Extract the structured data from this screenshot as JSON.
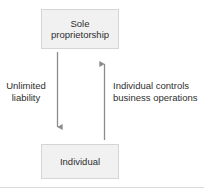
{
  "diagram": {
    "colors": {
      "node_fill": "#f1f1f1",
      "node_border": "#d5d5d5",
      "text": "#2e2e2e",
      "arrow": "#8c8c8c",
      "rule": "#d9d9d9",
      "background": "#ffffff"
    },
    "nodes": [
      {
        "id": "sole-proprietorship",
        "label": "Sole\nproprietorship"
      },
      {
        "id": "individual",
        "label": "Individual"
      }
    ],
    "edges": [
      {
        "id": "unlimited-liability",
        "label": "Unlimited\nliability",
        "direction": "down",
        "from": "sole-proprietorship",
        "to": "individual"
      },
      {
        "id": "individual-controls",
        "label": "Individual controls\nbusiness operations",
        "direction": "up",
        "from": "individual",
        "to": "sole-proprietorship"
      }
    ]
  }
}
